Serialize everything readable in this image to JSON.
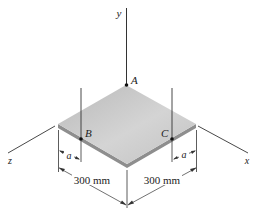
{
  "diagram": {
    "axes": {
      "y_label": "y",
      "x_label": "x",
      "z_label": "z"
    },
    "points": {
      "A": "A",
      "B": "B",
      "C": "C"
    },
    "dimensions": {
      "left_length": "300 mm",
      "right_length": "300 mm",
      "left_offset": "a",
      "right_offset": "a"
    },
    "colors": {
      "plate_top": "#c4c4c4",
      "plate_edge": "#8e8e8e",
      "line": "#333333"
    }
  }
}
